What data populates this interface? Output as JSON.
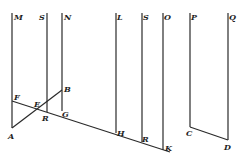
{
  "diagram": {
    "type": "geometric figure",
    "line_color": "#2a2a2a",
    "vertical_lines": [
      {
        "top_label": "M",
        "bottom_label": "A",
        "x": 12,
        "y1": 13,
        "y2": 128
      },
      {
        "top_label": "S",
        "bottom_label": "R",
        "x": 47,
        "y1": 13,
        "y2": 112
      },
      {
        "top_label": "N",
        "bottom_label": "G",
        "x": 62,
        "y1": 13,
        "y2": 111
      },
      {
        "top_label": "L",
        "bottom_label": "H",
        "x": 116,
        "y1": 13,
        "y2": 133
      },
      {
        "top_label": "S",
        "bottom_label": "R",
        "x": 142,
        "y1": 13,
        "y2": 142
      },
      {
        "top_label": "O",
        "bottom_label": "K",
        "x": 163,
        "y1": 13,
        "y2": 150
      },
      {
        "top_label": "P",
        "bottom_label": "C",
        "x": 190,
        "y1": 13,
        "y2": 127
      },
      {
        "top_label": "Q",
        "bottom_label": "D",
        "x": 228,
        "y1": 13,
        "y2": 140
      }
    ],
    "slanted_lines": [
      {
        "from": "F",
        "to": "K",
        "x1": 12,
        "y1": 101,
        "x2": 170,
        "y2": 152
      },
      {
        "from": "A",
        "to": "B",
        "x1": 12,
        "y1": 128,
        "x2": 62,
        "y2": 90
      },
      {
        "from": "C",
        "to": "D",
        "x1": 190,
        "y1": 127,
        "x2": 228,
        "y2": 140
      }
    ],
    "labels": {
      "M": "M",
      "S1": "S",
      "N": "N",
      "L": "L",
      "S2": "S",
      "O": "O",
      "P": "P",
      "Q": "Q",
      "F": "F",
      "E": "E",
      "B": "B",
      "A": "A",
      "R1": "R",
      "G": "G",
      "H": "H",
      "R2": "R",
      "K": "K",
      "C": "C",
      "D": "D"
    }
  }
}
